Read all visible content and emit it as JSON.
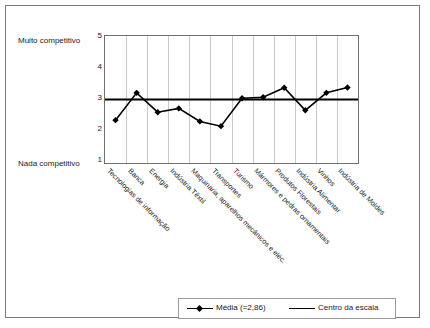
{
  "chart_data": {
    "type": "line",
    "title": "",
    "xlabel": "",
    "ylabel": "",
    "ylim": [
      1,
      5
    ],
    "yticks": [
      1,
      2,
      3,
      4,
      5
    ],
    "grid": "vertical",
    "legend_position": "bottom",
    "axis_captions": {
      "top": "Muito competitivo",
      "bottom": "Nada competitivo"
    },
    "categories": [
      "Tecnologias de informação",
      "Banca",
      "Energia",
      "Indústria Têxtil",
      "Maquinaria, aparelhos mecânicos e eléc.",
      "Transportes",
      "Turismo",
      "Mármores e pedras ornamentais",
      "Produtos Florestais",
      "Indústria Alimentar",
      "Vinhos",
      "Indústria de Moldes"
    ],
    "series": [
      {
        "name": "Média (=2,86)",
        "marker": "diamond",
        "color": "#000000",
        "values": [
          2.35,
          3.21,
          2.6,
          2.72,
          2.31,
          2.16,
          3.04,
          3.07,
          3.37,
          2.66,
          3.21,
          3.38
        ]
      },
      {
        "name": "Centro da escala",
        "marker": "none",
        "color": "#000000",
        "constant": 3.0,
        "values": [
          3.0,
          3.0,
          3.0,
          3.0,
          3.0,
          3.0,
          3.0,
          3.0,
          3.0,
          3.0,
          3.0,
          3.0
        ]
      }
    ],
    "mean_value": "2,86"
  },
  "legend": {
    "mean_label": "Média (=2,86)",
    "center_label": "Centro da escala"
  },
  "yaxis": {
    "tick_5": "5",
    "tick_4": "4",
    "tick_3": "3",
    "tick_2": "2",
    "tick_1": "1",
    "caption_top": "Muito competitivo",
    "caption_bottom": "Nada competitivo"
  },
  "xaxis": {
    "labels": [
      "Tecnologias de informação",
      "Banca",
      "Energia",
      "Indústria Têxtil",
      "Maquinaria, aparelhos mecânicos e eléc.",
      "Transportes",
      "Turismo",
      "Mármores e pedras ornamentais",
      "Produtos Florestais",
      "Indústria Alimentar",
      "Vinhos",
      "Indústria de Moldes"
    ]
  },
  "colors": {
    "series": "#000000",
    "grid": "#c9c9c9",
    "axis": "#6f6f6f",
    "frame": "#7a7a7a",
    "background": "#ffffff"
  }
}
